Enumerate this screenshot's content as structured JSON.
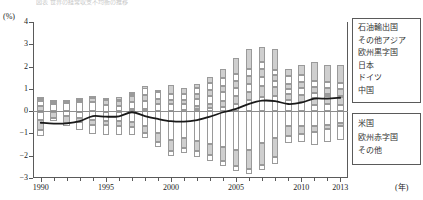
{
  "caption": {
    "top_clipped_text": "図表  世界の経常収支不均衡の推移"
  },
  "axes": {
    "y_unit_label": "(%)",
    "x_unit_label": "(年)",
    "y_ticks": [
      4,
      3,
      2,
      1,
      0,
      -1,
      -2,
      -3
    ],
    "y_tick_labels": [
      "4",
      "3",
      "2",
      "1",
      "0",
      "−1",
      "−2",
      "−3"
    ],
    "x_tick_labels": [
      "1990",
      "1995",
      "2000",
      "2005",
      "2010",
      "2013"
    ],
    "x_tick_years": [
      1990,
      1995,
      2000,
      2005,
      2010,
      2013
    ]
  },
  "legend_top": {
    "items": [
      {
        "label": "石油輸出国"
      },
      {
        "label": "その他アジア"
      },
      {
        "label": "欧州黒字国"
      },
      {
        "label": "日本"
      },
      {
        "label": "ドイツ"
      },
      {
        "label": "中国"
      }
    ]
  },
  "legend_bottom": {
    "items": [
      {
        "label": "米国"
      },
      {
        "label": "欧州赤字国"
      },
      {
        "label": "その他"
      }
    ]
  },
  "chart_data": {
    "type": "bar",
    "subtype": "stacked-bar-with-line",
    "title": "",
    "xlabel": "(年)",
    "ylabel": "(%)",
    "ylim": [
      -3,
      4
    ],
    "xlim": [
      1989.4,
      2013.6
    ],
    "grid": false,
    "legend_position": "right",
    "categories": [
      1990,
      1991,
      1992,
      1993,
      1994,
      1995,
      1996,
      1997,
      1998,
      1999,
      2000,
      2001,
      2002,
      2003,
      2004,
      2005,
      2006,
      2007,
      2008,
      2009,
      2010,
      2011,
      2012,
      2013
    ],
    "positive_series": [
      {
        "name": "中国",
        "color": "#9a9a9a",
        "values": [
          0.02,
          0.05,
          0.04,
          0.0,
          0.03,
          0.01,
          0.02,
          0.1,
          0.1,
          0.05,
          0.06,
          0.05,
          0.11,
          0.13,
          0.17,
          0.33,
          0.49,
          0.65,
          0.66,
          0.48,
          0.42,
          0.28,
          0.31,
          0.29
        ]
      },
      {
        "name": "ドイツ",
        "color": "#9a9a9a",
        "values": [
          0.22,
          -0.06,
          -0.06,
          -0.03,
          -0.04,
          -0.05,
          -0.02,
          -0.01,
          -0.02,
          -0.05,
          -0.1,
          0.0,
          0.13,
          0.19,
          0.29,
          0.34,
          0.39,
          0.5,
          0.43,
          0.3,
          0.32,
          0.33,
          0.35,
          0.35
        ]
      },
      {
        "name": "日本",
        "color": "#9a9a9a",
        "values": [
          0.21,
          0.35,
          0.4,
          0.43,
          0.42,
          0.33,
          0.23,
          0.32,
          0.39,
          0.33,
          0.36,
          0.28,
          0.32,
          0.38,
          0.42,
          0.38,
          0.35,
          0.39,
          0.25,
          0.23,
          0.31,
          0.2,
          0.09,
          0.06
        ]
      },
      {
        "name": "欧州黒字国",
        "color": "#9a9a9a",
        "values": [
          0.1,
          0.08,
          0.09,
          0.13,
          0.18,
          0.22,
          0.24,
          0.26,
          0.25,
          0.2,
          0.18,
          0.19,
          0.22,
          0.23,
          0.27,
          0.3,
          0.33,
          0.35,
          0.27,
          0.22,
          0.25,
          0.26,
          0.29,
          0.31
        ]
      },
      {
        "name": "その他アジア",
        "color": "#9a9a9a",
        "values": [
          0.05,
          0.04,
          0.03,
          0.03,
          0.05,
          0.05,
          0.04,
          0.1,
          0.4,
          0.33,
          0.28,
          0.27,
          0.28,
          0.33,
          0.32,
          0.3,
          0.32,
          0.3,
          0.22,
          0.34,
          0.3,
          0.28,
          0.26,
          0.27
        ]
      },
      {
        "name": "石油輸出国",
        "color": "#9a9a9a",
        "values": [
          0.03,
          0.02,
          0.02,
          0.02,
          0.03,
          0.05,
          0.13,
          0.08,
          -0.12,
          0.11,
          0.4,
          0.26,
          0.15,
          0.27,
          0.42,
          0.75,
          0.92,
          0.7,
          0.95,
          0.32,
          0.49,
          0.86,
          0.78,
          0.78
        ]
      }
    ],
    "negative_series": [
      {
        "name": "米国",
        "color": "#9a9a9a",
        "values": [
          -0.4,
          -0.02,
          -0.2,
          -0.3,
          -0.41,
          -0.42,
          -0.44,
          -0.49,
          -0.67,
          -0.97,
          -1.29,
          -1.19,
          -1.35,
          -1.49,
          -1.63,
          -1.75,
          -1.76,
          -1.45,
          -1.2,
          -0.66,
          -0.68,
          -0.65,
          -0.62,
          -0.55
        ]
      },
      {
        "name": "欧州赤字国",
        "color": "#9a9a9a",
        "values": [
          -0.45,
          -0.3,
          -0.32,
          -0.2,
          -0.2,
          -0.22,
          -0.23,
          -0.22,
          -0.32,
          -0.43,
          -0.48,
          -0.45,
          -0.45,
          -0.5,
          -0.6,
          -0.7,
          -0.82,
          -0.95,
          -0.85,
          -0.45,
          -0.36,
          -0.3,
          -0.18,
          -0.12
        ]
      },
      {
        "name": "その他",
        "color": "#9a9a9a",
        "values": [
          -0.25,
          -0.12,
          -0.13,
          -0.35,
          -0.42,
          -0.42,
          -0.4,
          -0.35,
          -0.22,
          -0.22,
          -0.23,
          -0.23,
          -0.25,
          -0.25,
          -0.23,
          -0.23,
          -0.23,
          -0.25,
          -0.3,
          -0.33,
          -0.35,
          -0.55,
          -0.6,
          -0.62
        ]
      }
    ],
    "line_series": {
      "name": "誤差・脱漏（ネット）",
      "color": "#1a1a1a",
      "values": [
        -0.52,
        -0.56,
        -0.55,
        -0.45,
        -0.22,
        -0.25,
        -0.23,
        -0.05,
        -0.22,
        -0.35,
        -0.45,
        -0.47,
        -0.4,
        -0.25,
        -0.05,
        0.1,
        0.33,
        0.47,
        0.45,
        0.32,
        0.38,
        0.56,
        0.56,
        0.6
      ]
    }
  }
}
